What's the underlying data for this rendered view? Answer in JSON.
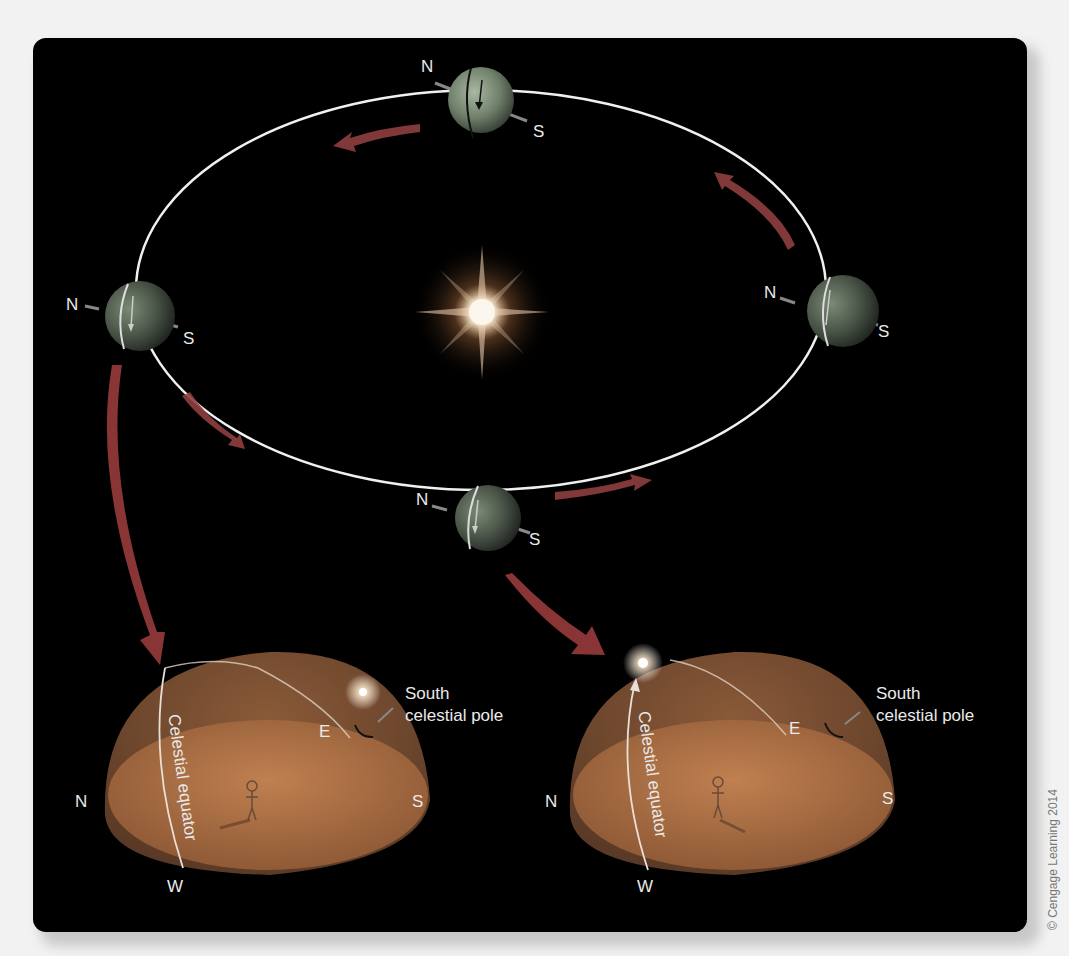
{
  "figure": {
    "orbit": {
      "earth_positions": [
        {
          "id": "top",
          "north_label": "N",
          "south_label": "S"
        },
        {
          "id": "left",
          "north_label": "N",
          "south_label": "S"
        },
        {
          "id": "right",
          "north_label": "N",
          "south_label": "S"
        },
        {
          "id": "bottom",
          "north_label": "N",
          "south_label": "S"
        }
      ],
      "center_object": "sun"
    },
    "domes": [
      {
        "id": "left-dome",
        "labels": {
          "north": "N",
          "south": "S",
          "east": "E",
          "west": "W"
        },
        "equator_label": "Celestial equator",
        "pole_label_line1": "South",
        "pole_label_line2": "celestial pole"
      },
      {
        "id": "right-dome",
        "labels": {
          "north": "N",
          "south": "S",
          "east": "E",
          "west": "W"
        },
        "equator_label": "Celestial equator",
        "pole_label_line1": "South",
        "pole_label_line2": "celestial pole"
      }
    ],
    "credit": "© Cengage Learning 2014"
  },
  "colors": {
    "background": "#000000",
    "page": "#f2f2f2",
    "orbit_line": "#f0f0f0",
    "arrow": "#7a3030",
    "dome_sky": "#7a4a2a",
    "dome_ground": "#b07040"
  }
}
